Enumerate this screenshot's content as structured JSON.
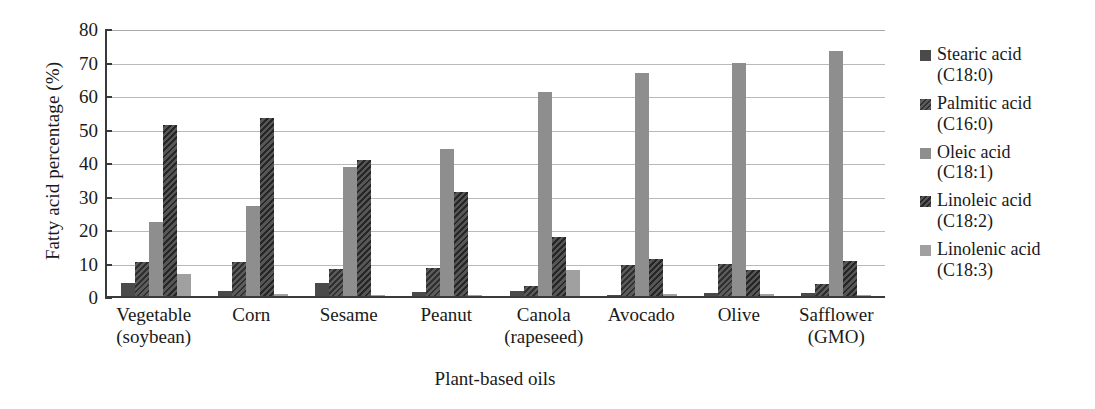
{
  "chart_data": {
    "type": "bar",
    "title": "",
    "xlabel": "Plant-based oils",
    "ylabel": "Fatty acid percentage (%)",
    "ylim": [
      0,
      80
    ],
    "ytick_step": 10,
    "yticks": [
      "80",
      "70",
      "60",
      "50",
      "40",
      "30",
      "20",
      "10",
      "0"
    ],
    "grid": true,
    "legend_position": "right",
    "categories": [
      "Vegetable (soybean)",
      "Corn",
      "Sesame",
      "Peanut",
      "Canola (rapeseed)",
      "Avocado",
      "Olive",
      "Safflower (GMO)"
    ],
    "category_lines": [
      {
        "line1": "Vegetable",
        "line2": "(soybean)"
      },
      {
        "line1": "Corn",
        "line2": ""
      },
      {
        "line1": "Sesame",
        "line2": ""
      },
      {
        "line1": "Peanut",
        "line2": ""
      },
      {
        "line1": "Canola",
        "line2": "(rapeseed)"
      },
      {
        "line1": "Avocado",
        "line2": ""
      },
      {
        "line1": "Olive",
        "line2": ""
      },
      {
        "line1": "Safflower",
        "line2": "(GMO)"
      }
    ],
    "series": [
      {
        "name": "Stearic acid",
        "code": "(C18:0)",
        "legend_label": "Stearic acid (C18:0)",
        "color": "#4a4a4a",
        "pattern": "solid-dark",
        "values": [
          4.0,
          1.5,
          4.0,
          1.3,
          1.5,
          0.4,
          0.8,
          0.8
        ]
      },
      {
        "name": "Palmitic acid",
        "code": "(C16:0)",
        "legend_label": "Palmitic acid (C16:0)",
        "color": "#5c5c5c",
        "pattern": "diagonal-hatch",
        "values": [
          10.2,
          10.1,
          8.0,
          8.3,
          3.0,
          9.2,
          9.5,
          3.5
        ]
      },
      {
        "name": "Oleic acid",
        "code": "(C18:1)",
        "legend_label": "Oleic acid (C18:1)",
        "color": "#8e8e8e",
        "pattern": "solid-medium-gray",
        "values": [
          22.0,
          27.0,
          38.5,
          44.0,
          61.0,
          66.5,
          69.5,
          73.0
        ]
      },
      {
        "name": "Linoleic acid",
        "code": "(C18:2)",
        "legend_label": "Linoleic acid (C18:2)",
        "color": "#565656",
        "pattern": "dense-diagonal-hatch",
        "values": [
          51.0,
          53.0,
          40.5,
          31.0,
          17.5,
          11.0,
          7.8,
          10.5
        ]
      },
      {
        "name": "Linolenic acid",
        "code": "(C18:3)",
        "legend_label": "Linolenic acid (C18:3)",
        "color": "#a0a0a0",
        "pattern": "solid-light-gray",
        "values": [
          6.5,
          0.7,
          0.3,
          0.2,
          7.7,
          0.5,
          0.6,
          0.2
        ]
      }
    ]
  }
}
